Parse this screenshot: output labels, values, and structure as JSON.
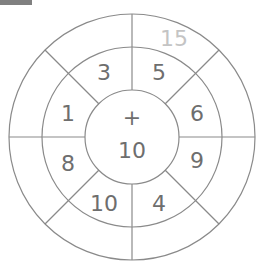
{
  "diagram": {
    "type": "number-wheel",
    "center": {
      "operator": "+",
      "value": "10"
    },
    "middle_ring": [
      {
        "position": "top-left",
        "value": "3"
      },
      {
        "position": "top-right",
        "value": "5"
      },
      {
        "position": "right-upper",
        "value": "6"
      },
      {
        "position": "right-lower",
        "value": "9"
      },
      {
        "position": "bottom-right",
        "value": "4"
      },
      {
        "position": "bottom-left",
        "value": "10"
      },
      {
        "position": "left-lower",
        "value": "8"
      },
      {
        "position": "left-upper",
        "value": "1"
      }
    ],
    "outer_ring": [
      {
        "position": "top-right",
        "value": "15",
        "style": "faded"
      }
    ],
    "colors": {
      "line": "#8a8a8a",
      "text": "#6e6e6e",
      "faded_text": "#c4c4c4"
    }
  }
}
